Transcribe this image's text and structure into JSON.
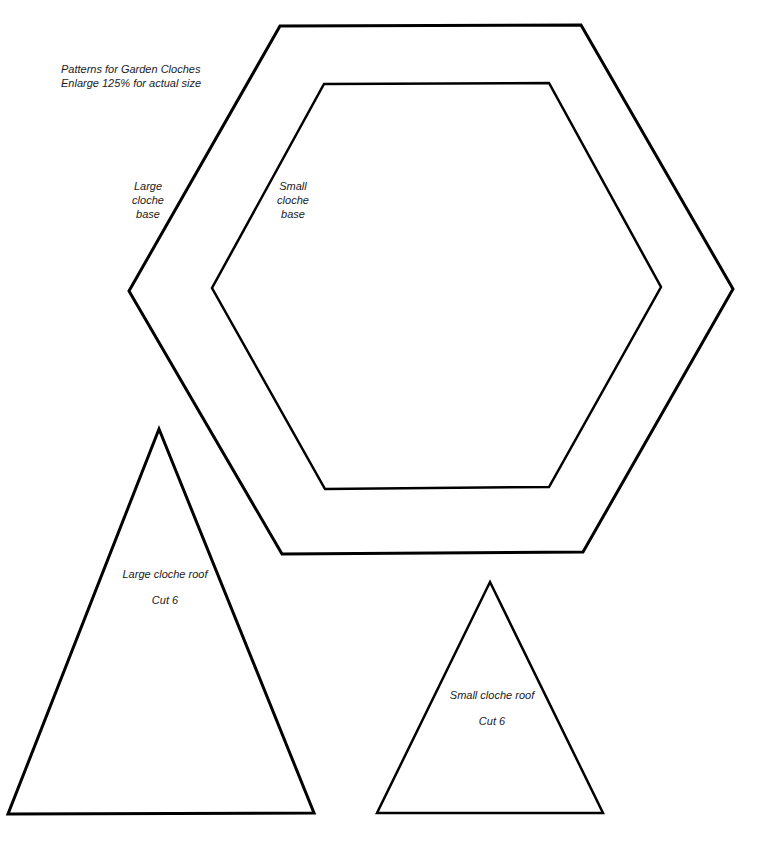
{
  "header": {
    "title": "Patterns for Garden Cloches",
    "subtitle": "Enlarge 125% for actual size"
  },
  "shapes": {
    "large_base": {
      "label_lines": [
        "Large",
        "cloche",
        "base"
      ],
      "points": "280,26 581,25 733,289 583,552 282,554 129,291"
    },
    "small_base": {
      "label_lines": [
        "Small",
        "cloche",
        "base"
      ],
      "points": "324,84 549,83 661,287 549,487 325,489 212,288"
    },
    "large_roof": {
      "label": "Large cloche roof",
      "cut": "Cut 6",
      "points": "159,429 314,813 8,814"
    },
    "small_roof": {
      "label": "Small cloche roof",
      "cut": "Cut 6",
      "points": "490,582 603,813 377,813"
    }
  },
  "colors": {
    "stroke": "#000000",
    "background": "#ffffff",
    "text": "#1a1a1a"
  }
}
